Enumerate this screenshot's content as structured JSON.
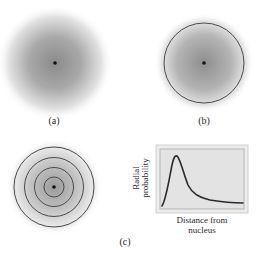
{
  "panels": {
    "a": {
      "label": "(a)",
      "description": "Diffuse electron density cloud with nucleus"
    },
    "b": {
      "label": "(b)",
      "description": "Electron cloud with boundary surface circle"
    },
    "c": {
      "label": "(c)",
      "description": "Concentric spherical shells and radial probability plot"
    }
  },
  "graph": {
    "ylabel_line1": "Radial",
    "ylabel_line2": "probability",
    "xlabel_line1": "Distance from",
    "xlabel_line2": "nucleus"
  },
  "colors": {
    "cloud_core": "#8a8a8a",
    "ring": "#4a4a4a",
    "nucleus": "#111111",
    "graph_bg": "#e4e4e4",
    "graph_border": "#bdbdbd",
    "curve": "#2a2a2a"
  }
}
